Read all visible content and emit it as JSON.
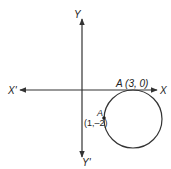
{
  "diagram": {
    "type": "coordinate-geometry",
    "axes": {
      "x_positive_label": "X",
      "x_negative_label": "X'",
      "y_positive_label": "Y",
      "y_negative_label": "Y'"
    },
    "circle": {
      "description": "Circle tangent to X-axis at A (3, 0), passing through (1, -2)"
    },
    "points": [
      {
        "name": "A",
        "coords": "(3, 0)",
        "label": "A (3, 0)"
      },
      {
        "name": "A",
        "coords": "(1,–2)",
        "label_name": "A",
        "label_coords": "(1,–2)"
      }
    ],
    "colors": {
      "line": "#333333",
      "text": "#222222",
      "background": "#ffffff"
    }
  }
}
